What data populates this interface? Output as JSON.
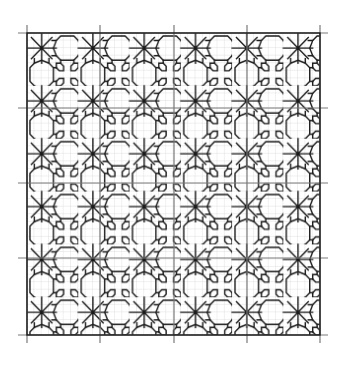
{
  "figure": {
    "type": "blackwork-embroidery-pattern",
    "grid": {
      "cells_x": 40,
      "cells_y": 40,
      "major_every": 10,
      "major_divisions": 4
    },
    "motif": {
      "repeat_cells": 7,
      "star_offset_cells": 2,
      "star_rays": 8
    },
    "colors": {
      "background": "#ffffff",
      "fine_grid": "#c8c8c8",
      "major_grid": "#7a7a7a",
      "stitch": "#1a1a1a"
    }
  }
}
